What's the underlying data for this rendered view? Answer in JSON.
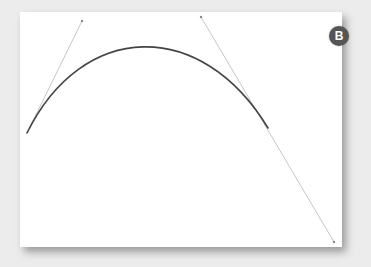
{
  "figure": {
    "label": "B",
    "background_color": "#ececec",
    "canvas_color": "#ffffff",
    "badge_color": "#555555",
    "curve_color": "#444444",
    "handle_color": "#b0b0b0"
  },
  "bezier": {
    "start": [
      27,
      133
    ],
    "control1": [
      82,
      21
    ],
    "control2": [
      201,
      17
    ],
    "end": [
      268,
      128
    ],
    "handle_extension_end": [
      334,
      242
    ]
  }
}
